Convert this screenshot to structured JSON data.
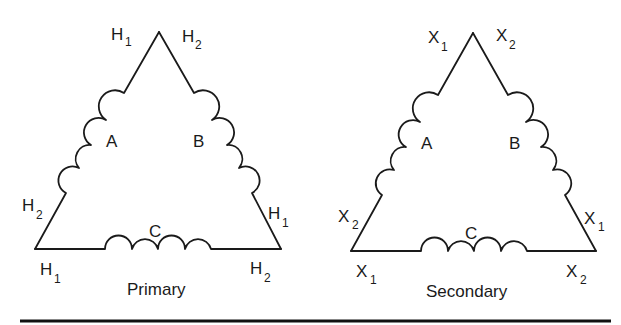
{
  "figure": {
    "colors": {
      "ink": "#1a1a1a",
      "background": "#ffffff",
      "rule": "#111111"
    }
  },
  "primary": {
    "caption": "Primary",
    "terminal_prefix": "H",
    "windings": [
      {
        "name": "A",
        "label": "A"
      },
      {
        "name": "B",
        "label": "B"
      },
      {
        "name": "C",
        "label": "C"
      }
    ],
    "terminals": {
      "apex_left": {
        "letter": "H",
        "sub": "1"
      },
      "apex_right": {
        "letter": "H",
        "sub": "2"
      },
      "left_side": {
        "letter": "H",
        "sub": "2"
      },
      "right_side": {
        "letter": "H",
        "sub": "1"
      },
      "bottom_left": {
        "letter": "H",
        "sub": "1"
      },
      "bottom_right": {
        "letter": "H",
        "sub": "2"
      }
    }
  },
  "secondary": {
    "caption": "Secondary",
    "terminal_prefix": "X",
    "windings": [
      {
        "name": "A",
        "label": "A"
      },
      {
        "name": "B",
        "label": "B"
      },
      {
        "name": "C",
        "label": "C"
      }
    ],
    "terminals": {
      "apex_left": {
        "letter": "X",
        "sub": "1"
      },
      "apex_right": {
        "letter": "X",
        "sub": "2"
      },
      "left_side": {
        "letter": "X",
        "sub": "2"
      },
      "right_side": {
        "letter": "X",
        "sub": "1"
      },
      "bottom_left": {
        "letter": "X",
        "sub": "1"
      },
      "bottom_right": {
        "letter": "X",
        "sub": "2"
      }
    }
  }
}
